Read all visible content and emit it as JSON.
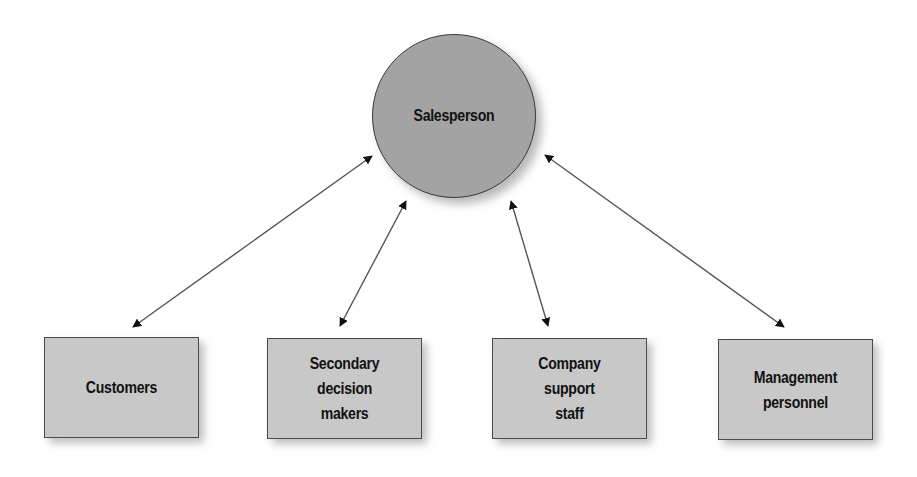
{
  "diagram": {
    "type": "hub-and-spoke",
    "hub": {
      "label": "Salesperson",
      "shape": "circle",
      "fill": "#a3a3a3"
    },
    "nodes": [
      {
        "id": "customers",
        "label": "Customers",
        "shape": "rectangle",
        "fill": "#c8c8c8"
      },
      {
        "id": "secondary",
        "label": "Secondary\ndecision\nmakers",
        "shape": "rectangle",
        "fill": "#c8c8c8"
      },
      {
        "id": "company",
        "label": "Company\nsupport\nstaff",
        "shape": "rectangle",
        "fill": "#c8c8c8"
      },
      {
        "id": "management",
        "label": "Management\npersonnel",
        "shape": "rectangle",
        "fill": "#c8c8c8"
      }
    ],
    "edges": [
      {
        "from": "Salesperson",
        "to": "Customers",
        "direction": "bidirectional"
      },
      {
        "from": "Salesperson",
        "to": "Secondary decision makers",
        "direction": "bidirectional"
      },
      {
        "from": "Salesperson",
        "to": "Company support staff",
        "direction": "bidirectional"
      },
      {
        "from": "Salesperson",
        "to": "Management personnel",
        "direction": "bidirectional"
      }
    ],
    "colors": {
      "arrow": "#1a1a1a",
      "line": "#555555",
      "border": "#4a4a4a"
    }
  }
}
